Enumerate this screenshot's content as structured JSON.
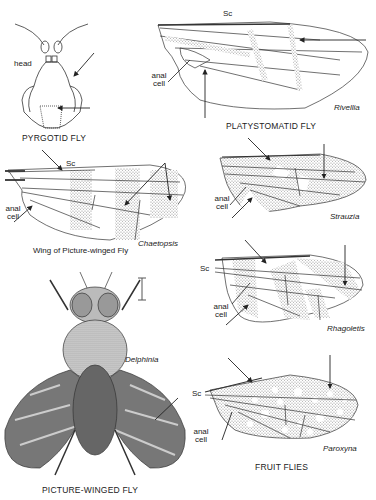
{
  "figures": {
    "pyrgotid": {
      "caption": "PYRGOTID FLY",
      "labels": {
        "head": "head"
      }
    },
    "platystomatid": {
      "caption": "PLATYSTOMATID FLY",
      "genus": "Rivellia",
      "labels": {
        "sc": "Sc",
        "anal_cell": "anal cell"
      }
    },
    "picture_wing": {
      "caption": "Wing of Picture-winged Fly",
      "genus": "Chaetopsis",
      "labels": {
        "sc": "Sc",
        "anal_cell": "anal cell"
      }
    },
    "strauzia": {
      "genus": "Strauzia",
      "labels": {
        "anal_cell": "anal cell"
      }
    },
    "rhagoletis": {
      "genus": "Rhagoletis",
      "labels": {
        "sc": "Sc",
        "anal_cell": "anal cell"
      }
    },
    "delphinia": {
      "caption": "PICTURE-WINGED FLY",
      "genus": "Delphinia"
    },
    "paroxyna": {
      "genus": "Paroxyna",
      "caption": "FRUIT FLIES",
      "labels": {
        "sc": "Sc",
        "anal_cell": "anal cell"
      }
    }
  }
}
